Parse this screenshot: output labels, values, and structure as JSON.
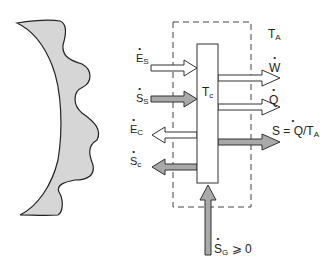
{
  "diagram": {
    "colors": {
      "outline": "#333333",
      "open_arrow_fill": "#ffffff",
      "gray_arrow_fill": "#a9a9a9",
      "shape_fill": "#d6d6d6",
      "dashed_boundary": "#444444"
    },
    "ambient_label": {
      "main": "T",
      "sub": "A"
    },
    "cell_label": {
      "main": "T",
      "sub": "c"
    },
    "inputs": [
      {
        "id": "Es",
        "main": "E",
        "sub": "S",
        "dot": true,
        "style": "open",
        "direction": "in"
      },
      {
        "id": "Ss",
        "main": "S",
        "sub": "S",
        "dot": true,
        "style": "gray",
        "direction": "in"
      }
    ],
    "outputs_left": [
      {
        "id": "Ec",
        "main": "E",
        "sub": "C",
        "dot": true,
        "style": "open",
        "direction": "out"
      },
      {
        "id": "Sc",
        "main": "S",
        "sub": "c",
        "dot": true,
        "style": "gray",
        "direction": "out"
      }
    ],
    "outputs_right": [
      {
        "id": "W",
        "main": "W",
        "sub": "",
        "dot": true,
        "style": "open"
      },
      {
        "id": "Q",
        "main": "Q",
        "sub": "",
        "dot": true,
        "style": "open"
      },
      {
        "id": "S",
        "main": "S = Q/T",
        "sub": "A",
        "dot": true,
        "style": "gray"
      }
    ],
    "generation": {
      "main": "S",
      "sub": "G",
      "suffix": "⩾ 0",
      "dot": true,
      "style": "gray",
      "direction": "up"
    },
    "source_shape": "wavy-crescent (radiation source / sun surface)"
  }
}
